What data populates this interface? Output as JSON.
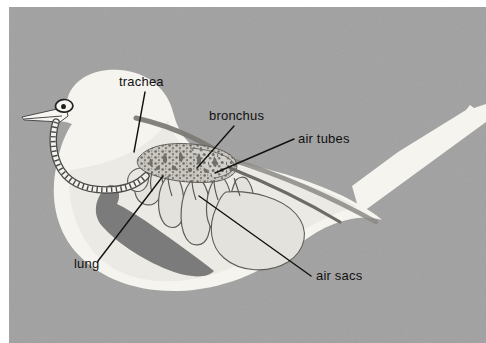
{
  "figure": {
    "background_color": "#a1a1a1",
    "border": {
      "top_strip_color": "#ffffff",
      "left_strip_color": "#ffffff"
    }
  },
  "palette": {
    "background_gray": "#a1a1a1",
    "body_white": "#f5f4ef",
    "body_offwhite": "#efeee8",
    "lung_dark_gray": "#7b7b7b",
    "air_sac_fill": "#dedcd6",
    "air_sac_fill_light": "#e8e7e1",
    "bronchus_mottled": "#8f8d86",
    "outline_dark": "#4a4a4a",
    "label_text": "#111111",
    "leader_line": "#111111",
    "shadow_gray": "#8b8b8b"
  },
  "labels": [
    {
      "id": "trachea",
      "text": "trachea",
      "text_x": 119,
      "text_y": 86,
      "leader": "M 145 92 L 134 152",
      "anchor": "start"
    },
    {
      "id": "bronchus",
      "text": "bronchus",
      "text_x": 209,
      "text_y": 120,
      "leader": "M 234 126 L 197 168",
      "anchor": "start"
    },
    {
      "id": "air-tubes",
      "text": "air tubes",
      "text_x": 298,
      "text_y": 143,
      "leader": "M 294 139 L 215 173",
      "anchor": "start"
    },
    {
      "id": "lung",
      "text": "lung",
      "text_x": 74,
      "text_y": 268,
      "leader": "M 98 261 L 163 176",
      "anchor": "start"
    },
    {
      "id": "air-sacs",
      "text": "air sacs",
      "text_x": 316,
      "text_y": 280,
      "leader": "M 311 276 L 199 196",
      "anchor": "start"
    }
  ],
  "anatomy_parts": [
    {
      "id": "body-outline",
      "name": "bird body silhouette"
    },
    {
      "id": "head",
      "name": "bird head"
    },
    {
      "id": "beak",
      "name": "beak"
    },
    {
      "id": "eye",
      "name": "eye"
    },
    {
      "id": "tail",
      "name": "tail feathers"
    },
    {
      "id": "trachea-tube",
      "name": "segmented trachea (windpipe)"
    },
    {
      "id": "bronchus-mass",
      "name": "bronchus / mottled lung tissue mass"
    },
    {
      "id": "lung-shape",
      "name": "dark gray lung"
    },
    {
      "id": "air-sac-cluster",
      "name": "air sacs lobes"
    },
    {
      "id": "air-tube-line",
      "name": "long air tube running to tail"
    },
    {
      "id": "body-shadow",
      "name": "back shadow line"
    }
  ]
}
